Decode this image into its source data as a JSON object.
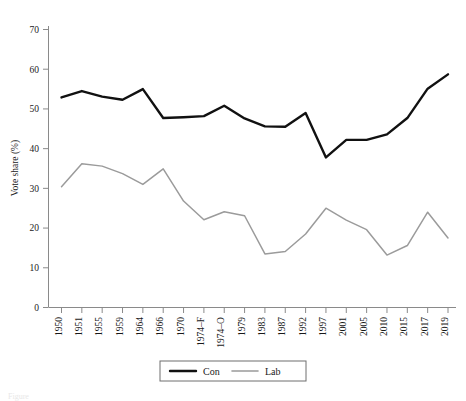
{
  "figure": {
    "caption": "Figure"
  },
  "axes": {
    "ylabel": "Vote share (%)",
    "xlabel": "",
    "yticks": [
      "0",
      "10",
      "20",
      "30",
      "40",
      "50",
      "60",
      "70"
    ],
    "xticks": [
      "1950",
      "1951",
      "1955",
      "1959",
      "1964",
      "1966",
      "1970",
      "1974–F",
      "1974–O",
      "1979",
      "1983",
      "1987",
      "1992",
      "1997",
      "2001",
      "2005",
      "2010",
      "2015",
      "2017",
      "2019"
    ]
  },
  "legend": {
    "items": [
      {
        "label": "Con",
        "color": "#111111"
      },
      {
        "label": "Lab",
        "color": "#9b9b9b"
      }
    ]
  },
  "colors": {
    "con": "#111111",
    "lab": "#9b9b9b",
    "axis": "#8a8a8a",
    "background": "#ffffff"
  },
  "chart_data": {
    "type": "line",
    "title": "",
    "xlabel": "",
    "ylabel": "Vote share (%)",
    "ylim": [
      0,
      70
    ],
    "grid": false,
    "legend_position": "bottom",
    "categories": [
      "1950",
      "1951",
      "1955",
      "1959",
      "1964",
      "1966",
      "1970",
      "1974–F",
      "1974–O",
      "1979",
      "1983",
      "1987",
      "1992",
      "1997",
      "2001",
      "2005",
      "2010",
      "2015",
      "2017",
      "2019"
    ],
    "series": [
      {
        "name": "Con",
        "color": "#111111",
        "values": [
          52.9,
          54.5,
          53.1,
          52.3,
          55.0,
          47.7,
          47.9,
          48.2,
          50.8,
          47.6,
          45.6,
          45.5,
          49.0,
          37.8,
          42.2,
          42.2,
          43.6,
          47.7,
          55.1,
          58.7
        ]
      },
      {
        "name": "Lab",
        "color": "#9b9b9b",
        "values": [
          30.4,
          36.2,
          35.6,
          33.7,
          31.0,
          34.9,
          26.8,
          22.1,
          24.1,
          23.1,
          13.5,
          14.1,
          18.5,
          25.0,
          22.0,
          19.6,
          13.2,
          15.6,
          24.0,
          17.5
        ]
      }
    ]
  }
}
